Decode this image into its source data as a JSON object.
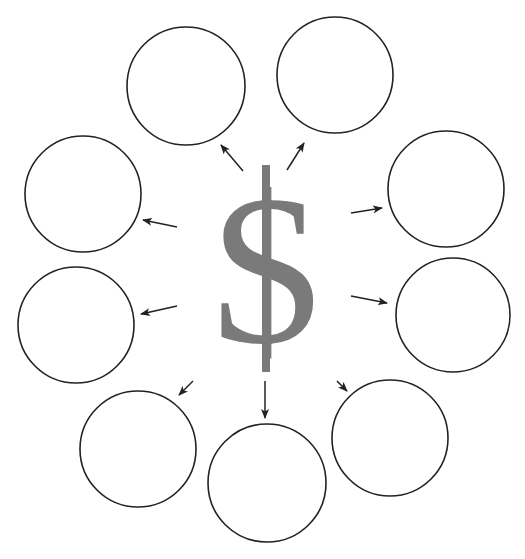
{
  "diagram": {
    "center_symbol": "$",
    "center_color": "#7a7a7a",
    "stroke_color": "#222222",
    "circles": [
      {
        "id": "top-left",
        "label": "",
        "cx": 186,
        "cy": 86,
        "r": 59
      },
      {
        "id": "top-right",
        "label": "",
        "cx": 335,
        "cy": 75,
        "r": 58
      },
      {
        "id": "left-upper",
        "label": "",
        "cx": 83,
        "cy": 194,
        "r": 58
      },
      {
        "id": "right-upper",
        "label": "",
        "cx": 446,
        "cy": 189,
        "r": 58
      },
      {
        "id": "left-lower",
        "label": "",
        "cx": 76,
        "cy": 325,
        "r": 58
      },
      {
        "id": "right-lower",
        "label": "",
        "cx": 453,
        "cy": 315,
        "r": 57
      },
      {
        "id": "bottom-left",
        "label": "",
        "cx": 138,
        "cy": 449,
        "r": 58
      },
      {
        "id": "bottom-center",
        "label": "",
        "cx": 267,
        "cy": 483,
        "r": 59
      },
      {
        "id": "bottom-right",
        "label": "",
        "cx": 390,
        "cy": 438,
        "r": 58
      }
    ],
    "arrows": [
      {
        "to": "top-left",
        "x1": 243,
        "y1": 171,
        "x2": 221,
        "y2": 145
      },
      {
        "to": "top-right",
        "x1": 287,
        "y1": 170,
        "x2": 304,
        "y2": 143
      },
      {
        "to": "left-upper",
        "x1": 177,
        "y1": 227,
        "x2": 143,
        "y2": 220
      },
      {
        "to": "left-lower",
        "x1": 177,
        "y1": 306,
        "x2": 141,
        "y2": 314
      },
      {
        "to": "right-upper",
        "x1": 351,
        "y1": 213,
        "x2": 382,
        "y2": 208
      },
      {
        "to": "right-lower",
        "x1": 351,
        "y1": 296,
        "x2": 387,
        "y2": 303
      },
      {
        "to": "bottom-left",
        "x1": 193,
        "y1": 381,
        "x2": 179,
        "y2": 395
      },
      {
        "to": "bottom-center",
        "x1": 265,
        "y1": 381,
        "x2": 265,
        "y2": 418
      },
      {
        "to": "bottom-right",
        "x1": 337,
        "y1": 381,
        "x2": 347,
        "y2": 391
      }
    ]
  }
}
